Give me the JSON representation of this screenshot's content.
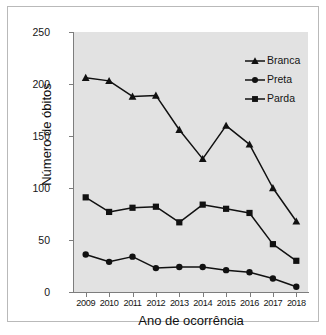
{
  "chart_data": {
    "type": "line",
    "title": "",
    "xlabel": "Ano de ocorrência",
    "ylabel": "Número de óbitos",
    "categories": [
      "2009",
      "2010",
      "2011",
      "2012",
      "2013",
      "2014",
      "2015",
      "2016",
      "2017",
      "2018"
    ],
    "series": [
      {
        "name": "Branca",
        "marker": "triangle",
        "color": "#111111",
        "values": [
          206,
          203,
          188,
          189,
          156,
          128,
          160,
          142,
          100,
          68
        ]
      },
      {
        "name": "Preta",
        "marker": "circle",
        "color": "#111111",
        "values": [
          36,
          29,
          34,
          23,
          24,
          24,
          21,
          19,
          13,
          5
        ]
      },
      {
        "name": "Parda",
        "marker": "square",
        "color": "#111111",
        "values": [
          91,
          77,
          81,
          82,
          67,
          84,
          80,
          76,
          46,
          30
        ]
      }
    ],
    "ylim": [
      0,
      250
    ],
    "yticks": [
      0,
      50,
      100,
      150,
      200,
      250
    ],
    "ytick_labels": [
      "0",
      "50",
      "100",
      "150",
      "200",
      "250"
    ],
    "grid": false,
    "legend_position": "top-right",
    "plot_background": "#e2e2e2",
    "figure_background": "#ffffff",
    "axis_color": "#7d7d7d"
  },
  "legend": {
    "entries": [
      {
        "label": "Branca"
      },
      {
        "label": "Preta"
      },
      {
        "label": "Parda"
      }
    ]
  }
}
